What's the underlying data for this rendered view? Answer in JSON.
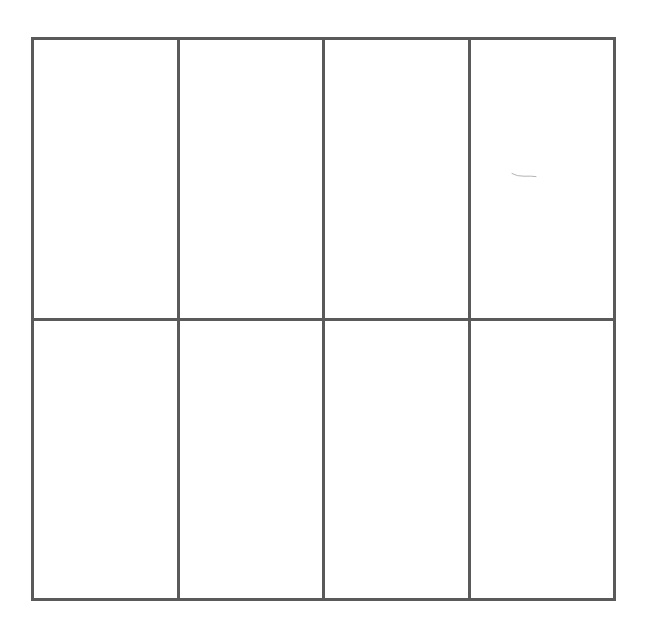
{
  "diagram": {
    "type": "grid",
    "rows": 2,
    "columns": 4,
    "line_color": "#5a5a5a",
    "background_color": "#ffffff",
    "cells": [
      {
        "row": 1,
        "col": 1,
        "label": ""
      },
      {
        "row": 1,
        "col": 2,
        "label": ""
      },
      {
        "row": 1,
        "col": 3,
        "label": ""
      },
      {
        "row": 1,
        "col": 4,
        "label": ""
      },
      {
        "row": 2,
        "col": 1,
        "label": ""
      },
      {
        "row": 2,
        "col": 2,
        "label": ""
      },
      {
        "row": 2,
        "col": 3,
        "label": ""
      },
      {
        "row": 2,
        "col": 4,
        "label": ""
      }
    ],
    "marks": [
      {
        "cell_row": 1,
        "cell_col": 4,
        "kind": "faint-stroke"
      }
    ]
  }
}
